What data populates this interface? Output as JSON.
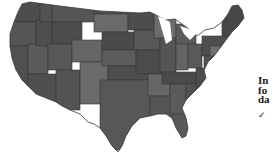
{
  "map": {
    "name": "United States",
    "style": "grayscale choropleth",
    "colors": {
      "dark": "#4a4a4a",
      "mid": "#595959",
      "light": "#6e6e6e",
      "border": "#3a3a3a",
      "background": "#ffffff"
    }
  },
  "side_panel": {
    "heading_lines": [
      "In",
      "fo",
      "da"
    ],
    "check_icon": "✓"
  }
}
